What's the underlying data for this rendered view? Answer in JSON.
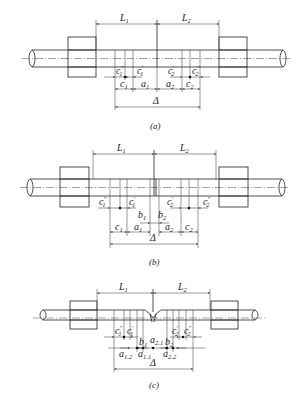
{
  "figure": {
    "panels": [
      {
        "id": "a",
        "caption": "(a)",
        "dimensions": {
          "L1": {
            "base": "L",
            "sub": "1"
          },
          "L2": {
            "base": "L",
            "sub": "2"
          },
          "c1pp": {
            "base": "c",
            "sub": "1",
            "sup": "″"
          },
          "c1p": {
            "base": "c",
            "sub": "1",
            "sup": "′"
          },
          "c2p": {
            "base": "c",
            "sub": "2",
            "sup": "′"
          },
          "c2pp": {
            "base": "c",
            "sub": "2",
            "sup": "″"
          },
          "c1": {
            "base": "c",
            "sub": "1"
          },
          "a1": {
            "base": "a",
            "sub": "1"
          },
          "a2": {
            "base": "a",
            "sub": "2"
          },
          "c2": {
            "base": "c",
            "sub": "2"
          },
          "delta": {
            "base": "Δ"
          }
        }
      },
      {
        "id": "b",
        "caption": "(b)",
        "dimensions": {
          "L1": {
            "base": "L",
            "sub": "1"
          },
          "L2": {
            "base": "L",
            "sub": "2"
          },
          "c1pp": {
            "base": "c",
            "sub": "1",
            "sup": "″"
          },
          "c1p": {
            "base": "c",
            "sub": "1",
            "sup": "′"
          },
          "c2p": {
            "base": "c",
            "sub": "2",
            "sup": "′"
          },
          "c2pp": {
            "base": "c",
            "sub": "2",
            "sup": "″"
          },
          "b1": {
            "base": "b",
            "sub": "1"
          },
          "b2": {
            "base": "b",
            "sub": "2"
          },
          "c1": {
            "base": "c",
            "sub": "1"
          },
          "a1": {
            "base": "a",
            "sub": "1"
          },
          "a2": {
            "base": "a",
            "sub": "2"
          },
          "c2": {
            "base": "c",
            "sub": "2"
          },
          "delta": {
            "base": "Δ"
          }
        }
      },
      {
        "id": "c",
        "caption": "(c)",
        "dimensions": {
          "L1": {
            "base": "L",
            "sub": "1"
          },
          "L2": {
            "base": "L",
            "sub": "2"
          },
          "c1pp": {
            "base": "c",
            "sub": "1",
            "sup": "″"
          },
          "c1p": {
            "base": "c",
            "sub": "1",
            "sup": "′"
          },
          "c2p": {
            "base": "c",
            "sub": "2",
            "sup": "′"
          },
          "c2pp": {
            "base": "c",
            "sub": "2",
            "sup": "″"
          },
          "b1": {
            "base": "b",
            "sub": "1"
          },
          "a21": {
            "base": "a",
            "sub": "2.1"
          },
          "b2": {
            "base": "b",
            "sub": "2"
          },
          "a12": {
            "base": "a",
            "sub": "1.2"
          },
          "a11": {
            "base": "a",
            "sub": "1.1"
          },
          "a22": {
            "base": "a",
            "sub": "2.2"
          },
          "delta": {
            "base": "Δ"
          }
        }
      }
    ]
  }
}
